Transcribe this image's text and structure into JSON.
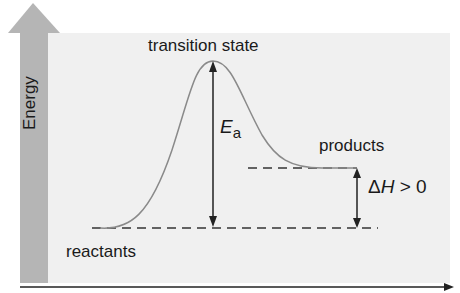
{
  "diagram": {
    "type": "reaction-energy-profile",
    "y_axis_label": "Energy",
    "x_axis_label": "",
    "labels": {
      "transition_state": "transition state",
      "products": "products",
      "reactants": "reactants",
      "activation_energy_symbol": "E",
      "activation_energy_subscript": "a",
      "enthalpy_delta": "Δ",
      "enthalpy_symbol": "H",
      "enthalpy_relation": " > 0"
    },
    "levels": {
      "reactants_y": 228,
      "products_y": 168,
      "transition_state_y": 61
    },
    "colors": {
      "background_panel": "#f0f0f0",
      "energy_arrow": "#b8b8b8",
      "energy_arrow_dark": "#a8a8a8",
      "curve": "#8a8a8a",
      "lines": "#333333",
      "text": "#1a1a1a"
    }
  }
}
